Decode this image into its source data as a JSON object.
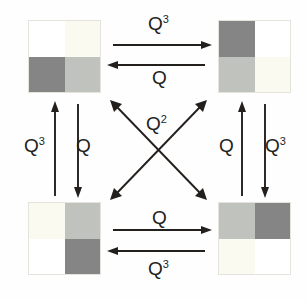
{
  "figure": {
    "background": "#fefefe"
  },
  "palette": {
    "white": "#ffffff",
    "cream": "#fbfaf0",
    "light_gray": "#c0c3bd",
    "dark_gray": "#858585",
    "ink": "#231f1c",
    "border": "#e4e4dd"
  },
  "states": [
    {
      "id": "state-top-left",
      "position": "top-left",
      "cells": [
        {
          "quadrant": "top-left",
          "shade": "white",
          "color": "#ffffff"
        },
        {
          "quadrant": "top-right",
          "shade": "cream",
          "color": "#fbfaf0"
        },
        {
          "quadrant": "bottom-left",
          "shade": "dark-gray",
          "color": "#858585"
        },
        {
          "quadrant": "bottom-right",
          "shade": "light-gray",
          "color": "#c0c3bd"
        }
      ]
    },
    {
      "id": "state-top-right",
      "position": "top-right",
      "cells": [
        {
          "quadrant": "top-left",
          "shade": "dark-gray",
          "color": "#858585"
        },
        {
          "quadrant": "top-right",
          "shade": "white",
          "color": "#ffffff"
        },
        {
          "quadrant": "bottom-left",
          "shade": "light-gray",
          "color": "#c0c3bd"
        },
        {
          "quadrant": "bottom-right",
          "shade": "cream",
          "color": "#fbfaf0"
        }
      ]
    },
    {
      "id": "state-bottom-left",
      "position": "bottom-left",
      "cells": [
        {
          "quadrant": "top-left",
          "shade": "cream",
          "color": "#fbfaf0"
        },
        {
          "quadrant": "top-right",
          "shade": "light-gray",
          "color": "#c0c3bd"
        },
        {
          "quadrant": "bottom-left",
          "shade": "white",
          "color": "#ffffff"
        },
        {
          "quadrant": "bottom-right",
          "shade": "dark-gray",
          "color": "#858585"
        }
      ]
    },
    {
      "id": "state-bottom-right",
      "position": "bottom-right",
      "cells": [
        {
          "quadrant": "top-left",
          "shade": "light-gray",
          "color": "#c0c3bd"
        },
        {
          "quadrant": "top-right",
          "shade": "dark-gray",
          "color": "#858585"
        },
        {
          "quadrant": "bottom-left",
          "shade": "cream",
          "color": "#fbfaf0"
        },
        {
          "quadrant": "bottom-right",
          "shade": "white",
          "color": "#ffffff"
        }
      ]
    }
  ],
  "transitions": {
    "top_forward": {
      "label": "Q",
      "exponent": "3",
      "direction": "left-to-right",
      "from": "state-top-left",
      "to": "state-top-right"
    },
    "top_reverse": {
      "label": "Q",
      "exponent": "",
      "direction": "right-to-left",
      "from": "state-top-right",
      "to": "state-top-left"
    },
    "bottom_forward": {
      "label": "Q",
      "exponent": "",
      "direction": "left-to-right",
      "from": "state-bottom-left",
      "to": "state-bottom-right"
    },
    "bottom_reverse": {
      "label": "Q",
      "exponent": "3",
      "direction": "right-to-left",
      "from": "state-bottom-right",
      "to": "state-bottom-left"
    },
    "left_up": {
      "label": "Q",
      "exponent": "3",
      "direction": "bottom-to-top",
      "from": "state-bottom-left",
      "to": "state-top-left"
    },
    "left_down": {
      "label": "Q",
      "exponent": "",
      "direction": "top-to-bottom",
      "from": "state-top-left",
      "to": "state-bottom-left"
    },
    "right_up": {
      "label": "Q",
      "exponent": "",
      "direction": "bottom-to-top",
      "from": "state-bottom-right",
      "to": "state-top-right"
    },
    "right_down": {
      "label": "Q",
      "exponent": "3",
      "direction": "top-to-bottom",
      "from": "state-top-right",
      "to": "state-bottom-right"
    },
    "diagonals": {
      "label": "Q",
      "exponent": "2",
      "direction": "bidirectional",
      "count": 2
    }
  },
  "labels": {
    "top_q3": "Q",
    "top_q3_sup": "3",
    "top_q": "Q",
    "bottom_q": "Q",
    "bottom_q3": "Q",
    "bottom_q3_sup": "3",
    "left_q3": "Q",
    "left_q3_sup": "3",
    "left_q": "Q",
    "right_q": "Q",
    "right_q3": "Q",
    "right_q3_sup": "3",
    "center_q2": "Q",
    "center_q2_sup": "2"
  }
}
